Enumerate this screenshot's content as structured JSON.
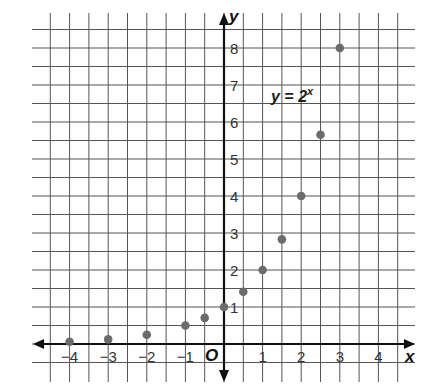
{
  "chart_data": {
    "type": "scatter",
    "title": "",
    "annotation": "y = 2^x",
    "annotation_base": "y = 2",
    "annotation_exp": "x",
    "xlabel": "x",
    "ylabel": "y",
    "origin_label": "O",
    "xlim": [
      -4.5,
      4.5
    ],
    "ylim": [
      -0.5,
      8.5
    ],
    "grid": true,
    "grid_step": 0.5,
    "x_ticks": [
      -4,
      -3,
      -2,
      -1,
      1,
      2,
      3,
      4
    ],
    "x_tick_labels": [
      "−4",
      "−3",
      "−2",
      "−1",
      "1",
      "2",
      "3",
      "4"
    ],
    "y_ticks": [
      1,
      2,
      3,
      4,
      5,
      6,
      7,
      8
    ],
    "y_tick_labels": [
      "1",
      "2",
      "3",
      "4",
      "5",
      "6",
      "7",
      "8"
    ],
    "series": [
      {
        "name": "y = 2^x",
        "x": [
          -4,
          -3,
          -2,
          -1,
          -0.5,
          0,
          0.5,
          1,
          1.5,
          2,
          2.5,
          3
        ],
        "y": [
          0.0625,
          0.125,
          0.25,
          0.5,
          0.707,
          1,
          1.414,
          2,
          2.828,
          4,
          5.657,
          8
        ]
      }
    ],
    "colors": {
      "points": "#6b6b6b",
      "grid": "#555555",
      "axis": "#111111"
    }
  }
}
